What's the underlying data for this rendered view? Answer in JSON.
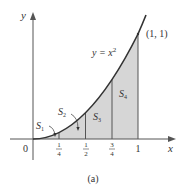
{
  "figure": {
    "caption": "(a)",
    "axes": {
      "x_label": "x",
      "y_label": "y",
      "origin_label": "0",
      "x_ticks": [
        {
          "num": "1",
          "den": "4",
          "value": 0.25
        },
        {
          "num": "1",
          "den": "2",
          "value": 0.5
        },
        {
          "num": "3",
          "den": "4",
          "value": 0.75
        },
        {
          "whole": "1",
          "value": 1
        }
      ]
    },
    "curve": {
      "equation_lhs": "y = x",
      "equation_exp": "2",
      "point_label": "(1, 1)"
    },
    "regions": [
      {
        "name": "S",
        "sub": "1"
      },
      {
        "name": "S",
        "sub": "2"
      },
      {
        "name": "S",
        "sub": "3"
      },
      {
        "name": "S",
        "sub": "4"
      }
    ],
    "colors": {
      "shade": "#d6d6d6",
      "curve": "#333333",
      "axes": "#555555",
      "text": "#333333"
    }
  }
}
